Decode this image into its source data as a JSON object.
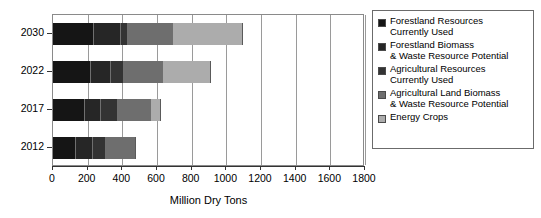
{
  "chart_data": {
    "type": "bar",
    "orientation": "horizontal",
    "stacked": true,
    "title": "",
    "subtitle": "",
    "xlabel": "Million Dry Tons",
    "ylabel": "",
    "xlim": [
      0,
      1800
    ],
    "ylim": null,
    "grid": true,
    "grid_axis": "x",
    "legend_position": "right",
    "xticks": [
      0,
      200,
      400,
      600,
      800,
      1000,
      1200,
      1400,
      1600,
      1800
    ],
    "xticklabels": [
      "0",
      "200",
      "400",
      "600",
      "800",
      "1000",
      "1200",
      "1400",
      "1600",
      "1800"
    ],
    "categories": [
      "2030",
      "2022",
      "2017",
      "2012"
    ],
    "category_order_top_to_bottom": [
      "2030",
      "2022",
      "2017",
      "2012"
    ],
    "series": [
      {
        "name": "Forestland Resources Currently Used",
        "color": "#151515",
        "values": [
          235,
          220,
          185,
          130
        ]
      },
      {
        "name": "Forestland Biomass & Waste Resource Potential",
        "color": "#262626",
        "values": [
          155,
          115,
          90,
          100
        ]
      },
      {
        "name": "Agricultural Resources Currently Used",
        "color": "#333333",
        "values": [
          40,
          75,
          100,
          75
        ]
      },
      {
        "name": "Agricultural Land Biomass & Waste Resource Potential",
        "color": "#6e6e6e",
        "values": [
          260,
          225,
          190,
          175
        ]
      },
      {
        "name": "Energy Crops",
        "color": "#acacac",
        "values": [
          405,
          275,
          60,
          0
        ]
      }
    ],
    "totals": [
      1095,
      910,
      625,
      480
    ],
    "annotations": []
  },
  "axes": {
    "x_title": "Million Dry Tons",
    "x_tick_labels": [
      "0",
      "200",
      "400",
      "600",
      "800",
      "1000",
      "1200",
      "1400",
      "1600",
      "1800"
    ],
    "y_tick_labels": [
      "2030",
      "2022",
      "2017",
      "2012"
    ]
  },
  "legend": {
    "items": [
      {
        "label": "Forestland Resources\nCurrently Used",
        "swatch_color": "#151515",
        "swatch_name": "legend-swatch-forestland-current"
      },
      {
        "label": "Forestland Biomass\n& Waste Resource Potential",
        "swatch_color": "#262626",
        "swatch_name": "legend-swatch-forestland-potential"
      },
      {
        "label": "Agricultural Resources\nCurrently Used",
        "swatch_color": "#333333",
        "swatch_name": "legend-swatch-agricultural-current"
      },
      {
        "label": "Agricultural Land Biomass\n& Waste Resource Potential",
        "swatch_color": "#6e6e6e",
        "swatch_name": "legend-swatch-agricultural-potential"
      },
      {
        "label": "Energy Crops",
        "swatch_color": "#acacac",
        "swatch_name": "legend-swatch-energy-crops"
      }
    ]
  },
  "style": {
    "background": "#ffffff",
    "axis_color": "#333333",
    "grid_color": "#9a9a9a",
    "plot_border_color": "#8a8a8a",
    "legend_border_color": "#6b6b6b"
  }
}
